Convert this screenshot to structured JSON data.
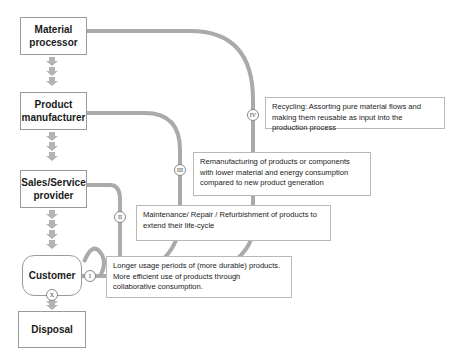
{
  "diagram": {
    "type": "circular-economy-value-chain",
    "colors": {
      "flow": "#aaaaaa",
      "node_border": "#9a9a9a",
      "text": "#1a1a1a"
    },
    "nodes": [
      {
        "id": "material-processor",
        "label": "Material processor"
      },
      {
        "id": "product-manufacturer",
        "label": "Product manufacturer"
      },
      {
        "id": "sales-service-provider",
        "label": "Sales/Service provider"
      },
      {
        "id": "customer",
        "label": "Customer"
      },
      {
        "id": "disposal",
        "label": "Disposal"
      }
    ],
    "loops": [
      {
        "badge": "I",
        "text": "Longer usage periods of (more durable) products. More efficient use of products through collaborative consumption."
      },
      {
        "badge": "II",
        "text": "Maintenance/ Repair / Refurbishment of products to extend their life-cycle"
      },
      {
        "badge": "III",
        "text": "Remanufacturing of products or components with lower material and energy consumption compared to new product generation"
      },
      {
        "badge": "IV",
        "text": "Recycling: Assorting pure material flows and making them reusable as input into the production process"
      }
    ],
    "disposal_badge": "X"
  }
}
